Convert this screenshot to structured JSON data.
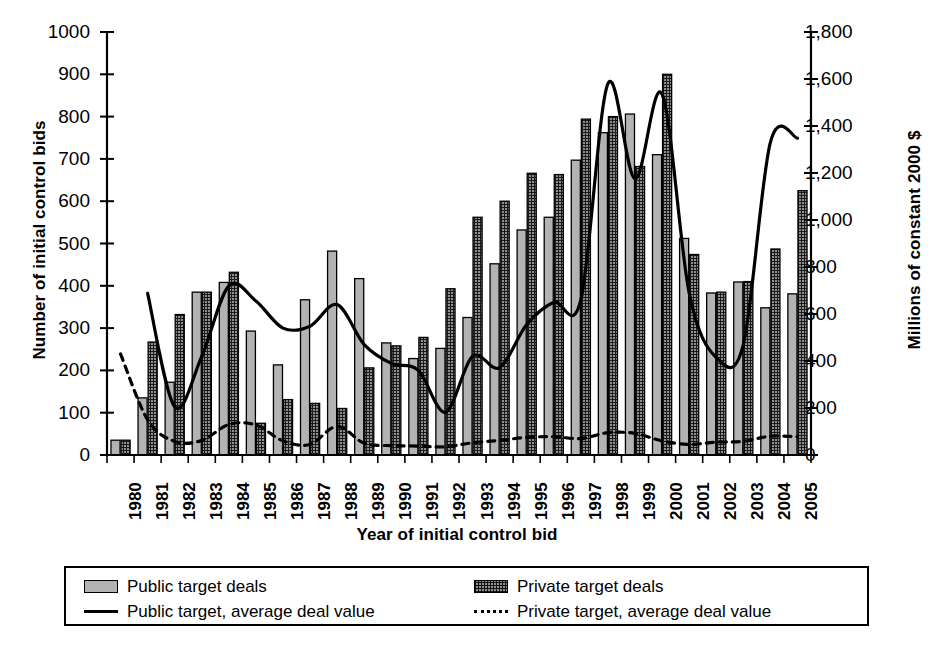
{
  "chart_data": {
    "type": "bar",
    "title": "",
    "xlabel": "Year of initial control bid",
    "ylabel": "Number of initial control bids",
    "ylabel_right": "Millions of constant 2000 $",
    "grid": false,
    "legend_position": "bottom",
    "ylim": [
      0,
      1000
    ],
    "ylim_right": [
      0,
      1800
    ],
    "yticks": [
      "0",
      "100",
      "200",
      "300",
      "400",
      "500",
      "600",
      "700",
      "800",
      "900",
      "1000"
    ],
    "yticks_right": [
      "0",
      "200",
      "400",
      "600",
      "800",
      "1,000",
      "1,200",
      "1,400",
      "1,600",
      "1,800"
    ],
    "categories": [
      "1980",
      "1981",
      "1982",
      "1983",
      "1984",
      "1985",
      "1986",
      "1987",
      "1988",
      "1989",
      "1990",
      "1991",
      "1992",
      "1993",
      "1994",
      "1995",
      "1996",
      "1997",
      "1998",
      "1999",
      "2000",
      "2001",
      "2002",
      "2003",
      "2004",
      "2005"
    ],
    "series": [
      {
        "name": "Public target deals",
        "kind": "bar",
        "axis": "left",
        "fill": "solid-gray",
        "values": [
          35,
          135,
          172,
          385,
          408,
          293,
          213,
          367,
          482,
          417,
          265,
          228,
          252,
          325,
          452,
          532,
          562,
          697,
          762,
          806,
          710,
          512,
          383,
          409,
          348,
          381
        ]
      },
      {
        "name": "Private target deals",
        "kind": "bar",
        "axis": "left",
        "fill": "cross-hatch",
        "values": [
          35,
          267,
          332,
          385,
          432,
          75,
          131,
          122,
          110,
          206,
          258,
          278,
          393,
          562,
          600,
          666,
          663,
          794,
          800,
          682,
          900,
          474,
          385,
          410,
          487,
          625
        ]
      },
      {
        "name": "Public target, average deal value",
        "kind": "line",
        "style": "solid",
        "axis": "right",
        "values": [
          null,
          688,
          205,
          420,
          720,
          655,
          540,
          548,
          640,
          470,
          390,
          360,
          182,
          420,
          372,
          555,
          650,
          660,
          1580,
          1175,
          1535,
          690,
          415,
          470,
          1330,
          1348
        ]
      },
      {
        "name": "Private target, average deal value",
        "kind": "line",
        "style": "dotted",
        "axis": "right",
        "values": [
          430,
          150,
          58,
          62,
          130,
          128,
          60,
          45,
          122,
          50,
          40,
          38,
          35,
          52,
          62,
          75,
          78,
          70,
          95,
          92,
          60,
          45,
          55,
          58,
          80,
          78
        ]
      }
    ],
    "legend": [
      {
        "label": "Public target deals",
        "marker": "swatch-solid-gray"
      },
      {
        "label": "Private target deals",
        "marker": "swatch-cross-hatch"
      },
      {
        "label": "Public target, average deal value",
        "marker": "line-solid"
      },
      {
        "label": "Private target, average deal value",
        "marker": "line-dotted"
      }
    ],
    "colors": {
      "public_bar": "#b3b3b3",
      "private_bar": "#8f8f8f",
      "line": "#000000",
      "axis": "#000000"
    }
  }
}
